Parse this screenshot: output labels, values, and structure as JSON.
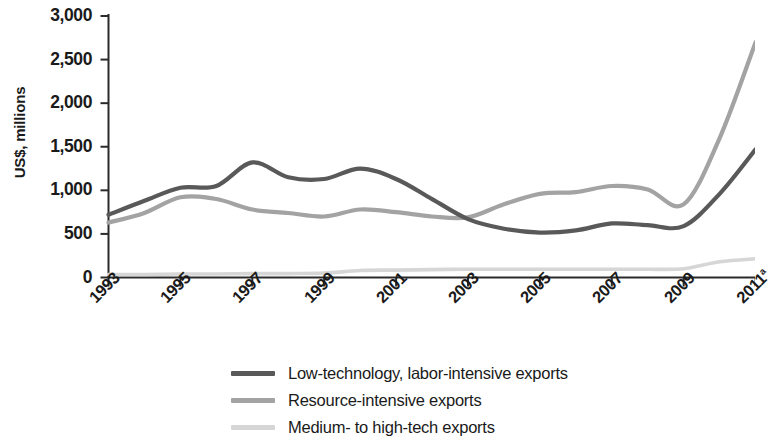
{
  "chart_data": {
    "type": "line",
    "title": "",
    "subtitle": "",
    "xlabel": "",
    "ylabel": "US$, millions",
    "xlim": [
      1993,
      2011
    ],
    "ylim": [
      0,
      3000
    ],
    "grid": false,
    "legend_position": "bottom-center",
    "x": [
      1993,
      1994,
      1995,
      1996,
      1997,
      1998,
      1999,
      2000,
      2001,
      2002,
      2003,
      2004,
      2005,
      2006,
      2007,
      2008,
      2009,
      2010,
      2011
    ],
    "x_tick_labels": [
      "1993",
      "1995",
      "1997",
      "1999",
      "2001",
      "2003",
      "2005",
      "2007",
      "2009",
      "2011ᵃ"
    ],
    "x_tick_values": [
      1993,
      1995,
      1997,
      1999,
      2001,
      2003,
      2005,
      2007,
      2009,
      2011
    ],
    "y_tick_labels": [
      "0",
      "500",
      "1,000",
      "1,500",
      "2,000",
      "2,500",
      "3,000"
    ],
    "y_tick_values": [
      0,
      500,
      1000,
      1500,
      2000,
      2500,
      3000
    ],
    "series": [
      {
        "name": "Low-technology, labor-intensive exports",
        "color": "#595959",
        "values": [
          720,
          880,
          1030,
          1050,
          1320,
          1150,
          1130,
          1250,
          1130,
          900,
          670,
          560,
          515,
          540,
          620,
          600,
          590,
          960,
          1470
        ]
      },
      {
        "name": "Resource-intensive exports",
        "color": "#a3a3a3",
        "values": [
          630,
          740,
          920,
          900,
          780,
          740,
          700,
          780,
          750,
          700,
          690,
          840,
          960,
          980,
          1050,
          1010,
          840,
          1600,
          2700
        ]
      },
      {
        "name": "Medium- to high-tech exports",
        "color": "#d6d6d6",
        "values": [
          35,
          35,
          40,
          40,
          45,
          45,
          50,
          80,
          85,
          90,
          95,
          95,
          95,
          95,
          95,
          95,
          100,
          180,
          215
        ]
      }
    ]
  },
  "axis": {
    "y_title": "US$, millions"
  },
  "legend": {
    "items": [
      {
        "label": "Low-technology, labor-intensive exports",
        "color": "#595959"
      },
      {
        "label": "Resource-intensive exports",
        "color": "#a3a3a3"
      },
      {
        "label": "Medium- to high-tech exports",
        "color": "#d6d6d6"
      }
    ]
  },
  "colors": {
    "axis": "#2b2b2b",
    "text": "#1a1a1a",
    "background": "#ffffff"
  }
}
